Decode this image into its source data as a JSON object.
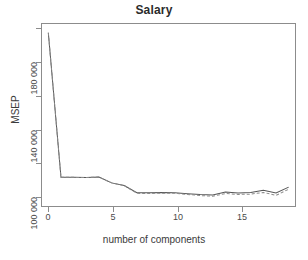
{
  "chart_data": {
    "type": "line",
    "title": "Salary",
    "xlabel": "number of components",
    "ylabel": "MSEP",
    "xlim": [
      -0.5,
      19.5
    ],
    "ylim": [
      88000,
      203000
    ],
    "grid": false,
    "legend": "none",
    "xticks": [
      0,
      5,
      10,
      15
    ],
    "xtick_labels": [
      "0",
      "5",
      "10",
      "15"
    ],
    "yticks": [
      100000,
      120000,
      140000,
      160000,
      180000,
      200000
    ],
    "ytick_labels": [
      "100 000",
      "",
      "140 000",
      "",
      "180 000",
      ""
    ],
    "ytick_labels_shown": [
      "100 000",
      "140 000",
      "180 000"
    ],
    "x": [
      0,
      1,
      2,
      3,
      4,
      5,
      6,
      7,
      8,
      9,
      10,
      11,
      12,
      13,
      14,
      15,
      16,
      17,
      18,
      19
    ],
    "series": [
      {
        "name": "CV",
        "style": "solid",
        "color": "#555555",
        "values": [
          197500,
          106200,
          106100,
          106000,
          106300,
          102600,
          100900,
          96400,
          96300,
          96500,
          96400,
          95800,
          95200,
          94900,
          96800,
          96200,
          96500,
          98000,
          96300,
          99900
        ]
      },
      {
        "name": "adjCV",
        "style": "dashed",
        "color": "#8a8a8a",
        "values": [
          197500,
          106200,
          106100,
          106000,
          106300,
          102600,
          100900,
          96000,
          95900,
          96100,
          96000,
          95300,
          94600,
          94200,
          95900,
          95300,
          95500,
          96600,
          94700,
          98600
        ]
      }
    ]
  }
}
